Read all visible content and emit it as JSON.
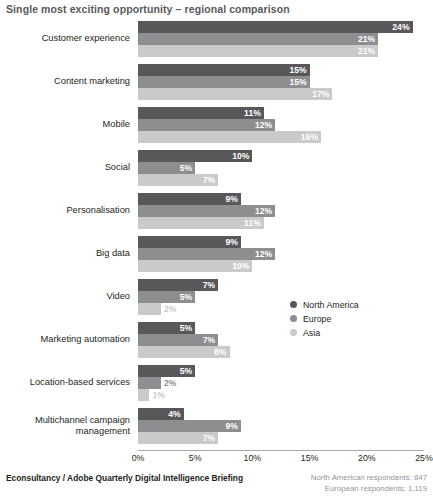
{
  "chart_data": {
    "type": "bar",
    "orientation": "horizontal",
    "title": "Single most exciting opportunity – regional comparison",
    "xlabel": "",
    "ylabel": "",
    "xlim": [
      0,
      25
    ],
    "grid": false,
    "legend_position": "middle-right",
    "tick_labels": [
      "0%",
      "5%",
      "10%",
      "15%",
      "20%",
      "25%"
    ],
    "tick_values": [
      0,
      5,
      10,
      15,
      20,
      25
    ],
    "categories": [
      "Customer experience",
      "Content marketing",
      "Mobile",
      "Social",
      "Personalisation",
      "Big data",
      "Video",
      "Marketing automation",
      "Location-based services",
      "Multichannel campaign management"
    ],
    "series": [
      {
        "name": "North America",
        "color": "#58585a",
        "values": [
          24,
          15,
          11,
          10,
          9,
          9,
          7,
          5,
          5,
          4
        ],
        "labels": [
          "24%",
          "15%",
          "11%",
          "10%",
          "9%",
          "9%",
          "7%",
          "5%",
          "5%",
          "4%"
        ]
      },
      {
        "name": "Europe",
        "color": "#8d8e90",
        "values": [
          21,
          15,
          12,
          5,
          12,
          12,
          5,
          7,
          2,
          9
        ],
        "labels": [
          "21%",
          "15%",
          "12%",
          "5%",
          "12%",
          "12%",
          "5%",
          "7%",
          "2%",
          "9%"
        ]
      },
      {
        "name": "Asia",
        "color": "#c9cacb",
        "values": [
          21,
          17,
          16,
          7,
          11,
          10,
          2,
          8,
          1,
          7
        ],
        "labels": [
          "21%",
          "17%",
          "16%",
          "7%",
          "11%",
          "10%",
          "2%",
          "8%",
          "1%",
          "7%"
        ]
      }
    ]
  },
  "footer": {
    "source": "Econsultancy / Adobe Quarterly Digital Intelligence Briefing",
    "respondents": [
      "North American respondents: 847",
      "European respondents: 1,119"
    ]
  }
}
